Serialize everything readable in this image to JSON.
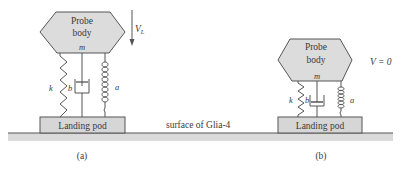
{
  "figure": {
    "ground_label": "surface of Glia-4",
    "colors": {
      "body_fill": "#dcdcdc",
      "pod_fill": "#d6d6d6",
      "ground_fill": "#dadada",
      "stroke": "#555555",
      "text": "#3a3a3a"
    }
  },
  "panels": [
    {
      "id": "a",
      "caption": "(a)",
      "body_line1": "Probe",
      "body_line2": "body",
      "mass_label": "m",
      "spring_label": "k",
      "damper_label": "b",
      "coil_label": "a",
      "pod_label": "Landing pod",
      "velocity_label": "V",
      "velocity_subscript": "L"
    },
    {
      "id": "b",
      "caption": "(b)",
      "body_line1": "Probe",
      "body_line2": "body",
      "mass_label": "m",
      "spring_label": "k",
      "damper_label": "b",
      "coil_label": "a",
      "pod_label": "Landing pod",
      "velocity_label": "V = 0"
    }
  ]
}
